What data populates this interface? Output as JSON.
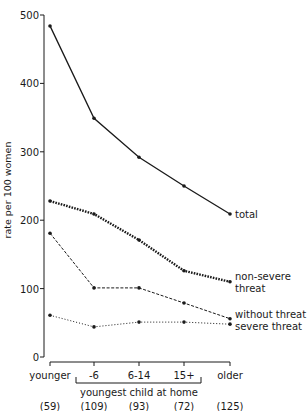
{
  "chart_data": {
    "type": "line",
    "title": "",
    "xlabel": "youngest child at home",
    "ylabel": "rate per 100 women",
    "ylim": [
      0,
      500
    ],
    "yticks": [
      0,
      100,
      200,
      300,
      400,
      500
    ],
    "categories": [
      "younger",
      "-6",
      "6-14",
      "15+",
      "older"
    ],
    "category_counts": [
      "(59)",
      "(109)",
      "(93)",
      "(72)",
      "(125)"
    ],
    "bracket_label": "youngest child at home",
    "bracket_span": [
      "-6",
      "15+"
    ],
    "grid": false,
    "series": [
      {
        "name": "total",
        "label_lines": [
          "total"
        ],
        "style": "solid",
        "values": [
          484,
          349,
          292,
          250,
          209
        ]
      },
      {
        "name": "non-severe threat",
        "label_lines": [
          "non-severe",
          "threat"
        ],
        "style": "dense-dotted",
        "values": [
          228,
          209,
          171,
          126,
          110
        ]
      },
      {
        "name": "without threat",
        "label_lines": [
          "without threat"
        ],
        "style": "dashed",
        "values": [
          181,
          101,
          101,
          79,
          56
        ]
      },
      {
        "name": "severe threat",
        "label_lines": [
          "severe threat"
        ],
        "style": "sparse-dotted",
        "values": [
          61,
          44,
          51,
          51,
          48
        ]
      }
    ],
    "legend_position": "inline-right"
  }
}
